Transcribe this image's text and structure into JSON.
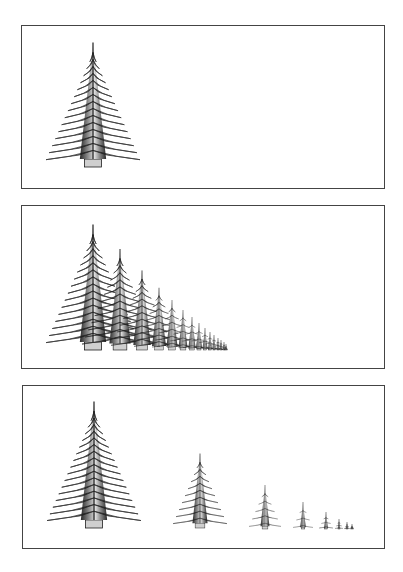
{
  "colors": {
    "frame": "#444444",
    "ink": "#1a1a1a",
    "fill": "#d8d8d8",
    "background": "#ffffff"
  },
  "panels": [
    {
      "id": "single-tree",
      "box": [
        21,
        25,
        364,
        164
      ],
      "trees": [
        {
          "apex": [
            93,
            45
          ],
          "base_y": 167,
          "half_width": 47
        }
      ]
    },
    {
      "id": "overlapping-row",
      "box": [
        21,
        205,
        364,
        164
      ],
      "trees": [
        {
          "apex": [
            93,
            227
          ],
          "base_y": 350,
          "half_width": 47
        },
        {
          "apex": [
            120,
            251
          ],
          "base_y": 350,
          "half_width": 38
        },
        {
          "apex": [
            142,
            272
          ],
          "base_y": 350,
          "half_width": 31
        },
        {
          "apex": [
            159,
            289
          ],
          "base_y": 350,
          "half_width": 25
        },
        {
          "apex": [
            172,
            301
          ],
          "base_y": 350,
          "half_width": 20
        },
        {
          "apex": [
            183,
            311
          ],
          "base_y": 350,
          "half_width": 16
        },
        {
          "apex": [
            192,
            318
          ],
          "base_y": 350,
          "half_width": 13
        },
        {
          "apex": [
            199,
            324
          ],
          "base_y": 350,
          "half_width": 11
        },
        {
          "apex": [
            205,
            329
          ],
          "base_y": 350,
          "half_width": 9
        },
        {
          "apex": [
            210,
            333
          ],
          "base_y": 350,
          "half_width": 7
        },
        {
          "apex": [
            214,
            336
          ],
          "base_y": 350,
          "half_width": 6
        },
        {
          "apex": [
            218,
            339
          ],
          "base_y": 350,
          "half_width": 5
        },
        {
          "apex": [
            221,
            341
          ],
          "base_y": 350,
          "half_width": 4
        },
        {
          "apex": [
            224,
            343
          ],
          "base_y": 350,
          "half_width": 3
        },
        {
          "apex": [
            226,
            345
          ],
          "base_y": 350,
          "half_width": 2
        }
      ]
    },
    {
      "id": "spaced-row",
      "box": [
        22,
        385,
        363,
        164
      ],
      "trees": [
        {
          "apex": [
            94,
            404
          ],
          "base_y": 528,
          "half_width": 47
        },
        {
          "apex": [
            200,
            455
          ],
          "base_y": 528,
          "half_width": 27
        },
        {
          "apex": [
            265,
            486
          ],
          "base_y": 529,
          "half_width": 16
        },
        {
          "apex": [
            303,
            503
          ],
          "base_y": 529,
          "half_width": 10
        },
        {
          "apex": [
            326,
            513
          ],
          "base_y": 529,
          "half_width": 7
        },
        {
          "apex": [
            339,
            520
          ],
          "base_y": 529,
          "half_width": 4
        },
        {
          "apex": [
            347,
            523
          ],
          "base_y": 529,
          "half_width": 3
        },
        {
          "apex": [
            352,
            525
          ],
          "base_y": 529,
          "half_width": 2
        }
      ]
    }
  ]
}
